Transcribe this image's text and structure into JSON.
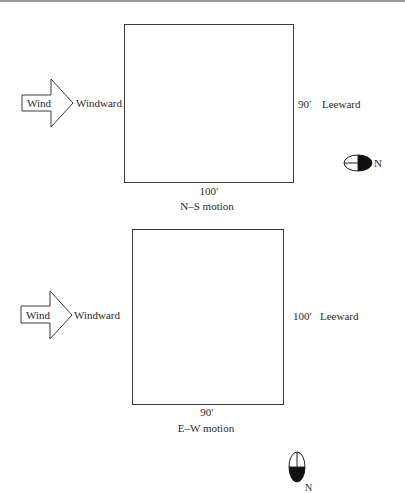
{
  "panels": [
    {
      "id": "ns",
      "arrow_label": "Wind",
      "windward_label": "Windward",
      "side_dimension": "90′",
      "leeward_label": "Leeward",
      "bottom_dimension": "100′",
      "caption": "N–S motion",
      "compass": {
        "orientation": "east",
        "label": "N"
      }
    },
    {
      "id": "ew",
      "arrow_label": "Wind",
      "windward_label": "Windward",
      "side_dimension": "100′",
      "leeward_label": "Leeward",
      "bottom_dimension": "90′",
      "caption": "E–W motion",
      "compass": {
        "orientation": "south",
        "label": "N"
      }
    }
  ],
  "colors": {
    "stroke": "#3a3a3a",
    "fill_dark": "#111111",
    "border_top": "#9a9a9a"
  }
}
